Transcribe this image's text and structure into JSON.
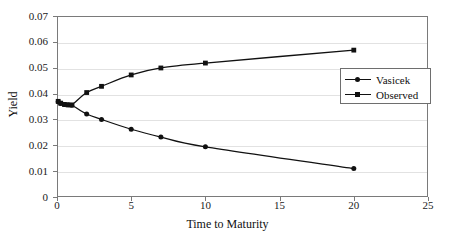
{
  "chart_data": {
    "type": "line",
    "title": "",
    "xlabel": "Time to Maturity",
    "ylabel": "Yield",
    "xlim": [
      0,
      25
    ],
    "ylim": [
      0,
      0.07
    ],
    "xticks": [
      0,
      5,
      10,
      15,
      20,
      25
    ],
    "xtick_labels": [
      "0",
      "5",
      "10",
      "15",
      "20",
      "25"
    ],
    "yticks": [
      0,
      0.01,
      0.02,
      0.03,
      0.04,
      0.05,
      0.06,
      0.07
    ],
    "ytick_labels": [
      "0",
      "0.01",
      "0.02",
      "0.03",
      "0.04",
      "0.05",
      "0.06",
      "0.07"
    ],
    "grid": "horizontal",
    "legend_position": "right-middle",
    "series": [
      {
        "name": "Vasicek",
        "marker": "circle",
        "color": "#111111",
        "x": [
          0.08,
          0.25,
          0.5,
          0.75,
          1,
          2,
          3,
          5,
          7,
          10,
          20
        ],
        "values": [
          0.0368,
          0.0362,
          0.0358,
          0.0357,
          0.0355,
          0.0321,
          0.03,
          0.0262,
          0.0232,
          0.0194,
          0.011
        ]
      },
      {
        "name": "Observed",
        "marker": "square",
        "color": "#111111",
        "x": [
          0.08,
          0.25,
          0.5,
          0.75,
          1,
          2,
          3,
          5,
          7,
          10,
          20
        ],
        "values": [
          0.037,
          0.0363,
          0.0358,
          0.0356,
          0.0356,
          0.0404,
          0.0428,
          0.0472,
          0.0499,
          0.0518,
          0.0568
        ]
      }
    ]
  },
  "legend": {
    "entries": [
      {
        "label": "Vasicek"
      },
      {
        "label": "Observed"
      }
    ]
  }
}
